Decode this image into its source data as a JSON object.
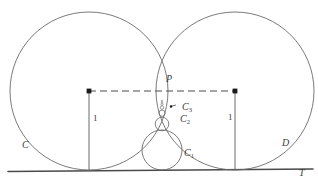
{
  "figure": {
    "labels": {
      "tangency_point": "P",
      "left_circle": "C",
      "right_circle": "D",
      "tangent_line": "T",
      "circle_1": "C",
      "circle_1_sub": "1",
      "circle_2": "C",
      "circle_2_sub": "2",
      "circle_3": "C",
      "circle_3_sub": "3",
      "left_radius": "1",
      "right_radius": "1"
    },
    "colors": {
      "stroke": "#6b6b6b",
      "baseline": "#4a4a4a",
      "label": "#3a3a3a",
      "dot": "#1a1a1a",
      "background": "#ffffff"
    }
  },
  "geometry": {
    "baseline_y": 170,
    "big_circles": [
      {
        "name": "C",
        "cx": 89,
        "cy": 91,
        "r": 79
      },
      {
        "name": "D",
        "cx": 235,
        "cy": 91,
        "r": 79
      }
    ],
    "tangency_point": {
      "x": 162,
      "y": 82
    },
    "radius_segments": [
      {
        "name": "left-radius",
        "x": 89,
        "y_top": 91,
        "y_bottom": 170,
        "value": "1"
      },
      {
        "name": "right-radius",
        "x": 235,
        "y_top": 91,
        "y_bottom": 170,
        "value": "1"
      }
    ],
    "dashed_chord": {
      "x1": 89,
      "y1": 91,
      "x2": 235,
      "y2": 91
    },
    "inscribed_circles": [
      {
        "name": "C1",
        "cx": 162,
        "cy": 150,
        "r": 20
      },
      {
        "name": "C2",
        "cx": 162,
        "cy": 124,
        "r": 6.8
      },
      {
        "name": "C3",
        "cx": 162,
        "cy": 113,
        "r": 3.1
      },
      {
        "name": "C4",
        "cx": 162,
        "cy": 107.5,
        "r": 1.75
      },
      {
        "name": "C5",
        "cx": 162,
        "cy": 104.2,
        "r": 1.1
      },
      {
        "name": "C6",
        "cx": 162,
        "cy": 102.0,
        "r": 0.75
      },
      {
        "name": "C7",
        "cx": 162,
        "cy": 100.4,
        "r": 0.55
      }
    ],
    "center_dots": [
      {
        "name": "left-center-dot",
        "x": 89,
        "y": 91
      },
      {
        "name": "right-center-dot",
        "x": 235,
        "y": 91
      },
      {
        "name": "c3-center-dot",
        "x": 172,
        "y": 106
      }
    ]
  }
}
